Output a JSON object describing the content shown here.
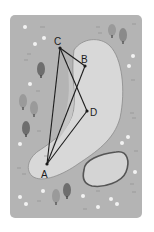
{
  "diagram": {
    "type": "map-with-geometry",
    "colors": {
      "page_bg": "#ffffff",
      "rough": "#b4b4b4",
      "fairway": "#d8d8d8",
      "fairway_edge": "#8c8c8c",
      "inner_shade": "#c6c6c6",
      "bunker_fill": "#d4d4d4",
      "bunker_edge": "#555555",
      "line": "#1c1c1c",
      "tree_dark": "#6e6e6e",
      "tree_light": "#9a9a9a",
      "flower": "#f2f2f2"
    },
    "points": [
      {
        "label": "A",
        "x": 47,
        "y": 164,
        "lx": 41,
        "ly": 178
      },
      {
        "label": "B",
        "x": 85,
        "y": 66,
        "lx": 81,
        "ly": 62
      },
      {
        "label": "C",
        "x": 60,
        "y": 48,
        "lx": 54,
        "ly": 44
      },
      {
        "label": "D",
        "x": 87,
        "y": 111,
        "lx": 90,
        "ly": 117
      }
    ],
    "segments": [
      [
        "C",
        "A"
      ],
      [
        "C",
        "B"
      ],
      [
        "C",
        "D"
      ],
      [
        "B",
        "A"
      ],
      [
        "D",
        "A"
      ]
    ]
  }
}
